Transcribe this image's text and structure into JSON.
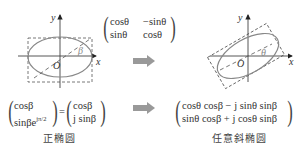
{
  "left_plot": {
    "axis_x": "x",
    "axis_y": "y",
    "origin": "O",
    "angle": "β"
  },
  "right_plot": {
    "axis_x": "x",
    "axis_y": "y",
    "origin": "O",
    "angle": "θ"
  },
  "rotation_matrix": {
    "r1c1": "cosθ",
    "r1c2": "−sinθ",
    "r2c1": "sinθ",
    "r2c2": "cosθ"
  },
  "left_vector": {
    "lhs_r1": "cosβ",
    "lhs_r2": "sinβe",
    "lhs_r2_exp": "jπ/2",
    "equals": "=",
    "rhs_r1": "cosβ",
    "rhs_r2": "j sinβ"
  },
  "right_vector": {
    "r1": "cosθ cosβ − j sinθ sinβ",
    "r2": "sinθ cosβ + j cosθ sinβ"
  },
  "captions": {
    "left": "正椭圆",
    "right": "任意斜椭圆"
  },
  "colors": {
    "ellipse": "#888888",
    "axis": "#444444",
    "dashed": "#555555",
    "arrow": "#999999"
  }
}
